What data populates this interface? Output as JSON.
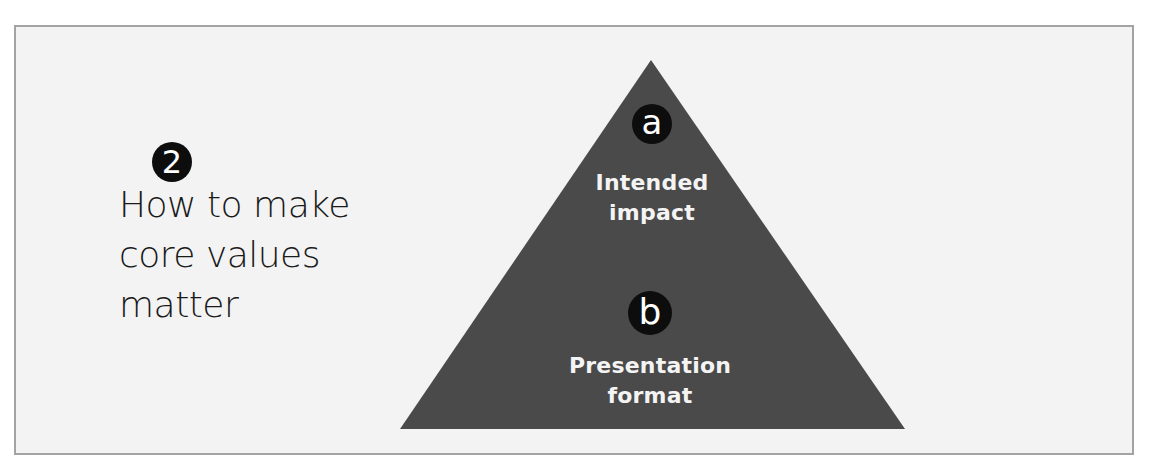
{
  "colors": {
    "page_background": "#ffffff",
    "panel_background": "#f3f3f3",
    "panel_border": "#a3a3a3",
    "pyramid_fill": "#4a4a4a",
    "badge_fill": "#0d0d0d",
    "badge_text": "#ffffff",
    "pyramid_text": "#f4f4f4",
    "title_text": "#1a1a1a"
  },
  "left_section": {
    "step_number": "2",
    "title_lines": [
      "How to make",
      "core values",
      "matter"
    ]
  },
  "pyramid": {
    "shape": "triangle",
    "apex": [
      651,
      60
    ],
    "base_left": [
      400,
      429
    ],
    "base_right": [
      905,
      429
    ],
    "levels": [
      {
        "marker": "a",
        "label_lines": [
          "Intended",
          "impact"
        ]
      },
      {
        "marker": "b",
        "label_lines": [
          "Presentation",
          "format"
        ]
      }
    ]
  }
}
